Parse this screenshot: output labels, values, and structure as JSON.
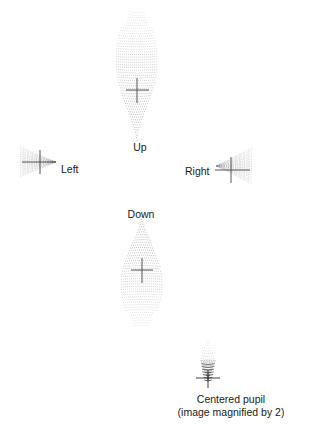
{
  "figure": {
    "type": "spot-diagrams",
    "labels": {
      "up": "Up",
      "left": "Left",
      "right": "Right",
      "down": "Down",
      "centered_line1": "Centered pupil",
      "centered_line2": "(image magnified by 2)"
    },
    "colors": {
      "dots": "#7a7a7a",
      "dots_dense": "#3a3a3a",
      "crosshair": "#444444",
      "text": "#1a1a1a",
      "background": "#ffffff"
    }
  }
}
